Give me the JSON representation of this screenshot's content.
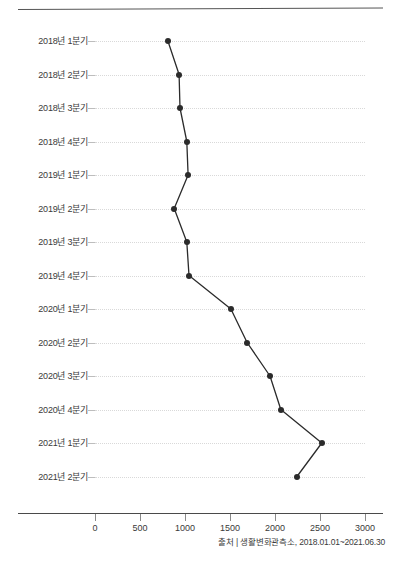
{
  "source_note": "출처 | 생활변화관측소, 2018.01.01~2021.06.30",
  "colors": {
    "line": "#2b2b2b",
    "dot": "#2b2b2b",
    "grid": "#d9d9d9",
    "axis": "#4a4a4a",
    "text": "#3a3a3a",
    "top_rule": "#555555"
  },
  "chart_data": {
    "type": "line",
    "orientation": "horizontal",
    "title": "",
    "subtitle": "",
    "xlabel": "",
    "ylabel": "",
    "grid": true,
    "legend": false,
    "legend_position": "none",
    "xlim": [
      0,
      3000
    ],
    "xticks": [
      0,
      500,
      1000,
      1500,
      2000,
      2500,
      3000
    ],
    "xtick_labels": [
      "0",
      "500",
      "1000",
      "1500",
      "2000",
      "2500",
      "3000"
    ],
    "categories": [
      "2018년 1분기",
      "2018년 2분기",
      "2018년 3분기",
      "2018년 4분기",
      "2019년 1분기",
      "2019년 2분기",
      "2019년 3분기",
      "2019년 4분기",
      "2020년 1분기",
      "2020년 2분기",
      "2020년 3분기",
      "2020년 4분기",
      "2021년 1분기",
      "2021년 2분기"
    ],
    "values": [
      810,
      935,
      945,
      1020,
      1035,
      880,
      1020,
      1045,
      1510,
      1690,
      1945,
      2065,
      2520,
      2245
    ],
    "annotations": [
      "출처 | 생활변화관측소, 2018.01.01~2021.06.30"
    ]
  }
}
